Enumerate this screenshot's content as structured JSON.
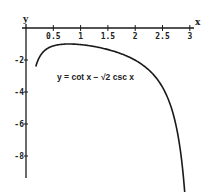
{
  "chart_data": {
    "type": "line",
    "title": "",
    "xlabel": "x",
    "ylabel": "y",
    "annotation": "y = cot x − √2 csc x",
    "x_ticks": [
      0.5,
      1,
      1.5,
      2,
      2.5,
      3
    ],
    "x_tick_labels": [
      "0.5",
      "1",
      "1.5",
      "2",
      "2.5",
      "3"
    ],
    "y_ticks": [
      -2,
      -4,
      -6,
      -8
    ],
    "y_tick_labels": [
      "-2",
      "-4",
      "-6",
      "-8"
    ],
    "xlim": [
      0,
      3.1
    ],
    "ylim": [
      -9.3,
      0
    ],
    "grid": false,
    "series": [
      {
        "name": "y = cot x − √2 csc x",
        "x": [
          0.18,
          0.25,
          0.35,
          0.5,
          0.65,
          0.785,
          1.0,
          1.25,
          1.5,
          1.75,
          2.0,
          2.25,
          2.5,
          2.7,
          2.85,
          2.97
        ],
        "y": [
          -4.12,
          -3.66,
          -2.15,
          -1.12,
          -1.11,
          -1.0,
          -1.04,
          -1.17,
          -1.41,
          -1.73,
          -2.37,
          -3.27,
          -4.47,
          -6.07,
          -8.0,
          -9.28
        ]
      }
    ],
    "colors": {
      "curve": "#1a1a1a",
      "axis": "#1a1a1a",
      "background": "#ffffff"
    }
  }
}
